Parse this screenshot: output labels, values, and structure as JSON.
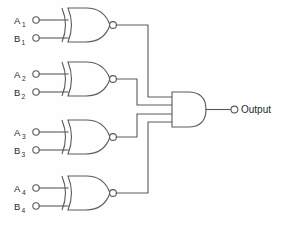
{
  "diagram": {
    "background_color": "#fefefe",
    "line_color": "#5a5a5a",
    "text_color": "#2b2b2b"
  },
  "gates": [
    {
      "id": "xnor1",
      "type": "XNOR",
      "inputs": [
        {
          "label": "A",
          "subscript": "1"
        },
        {
          "label": "B",
          "subscript": "1"
        }
      ]
    },
    {
      "id": "xnor2",
      "type": "XNOR",
      "inputs": [
        {
          "label": "A",
          "subscript": "2"
        },
        {
          "label": "B",
          "subscript": "2"
        }
      ]
    },
    {
      "id": "xnor3",
      "type": "XNOR",
      "inputs": [
        {
          "label": "A",
          "subscript": "3"
        },
        {
          "label": "B",
          "subscript": "3"
        }
      ]
    },
    {
      "id": "xnor4",
      "type": "XNOR",
      "inputs": [
        {
          "label": "A",
          "subscript": "4"
        },
        {
          "label": "B",
          "subscript": "4"
        }
      ]
    },
    {
      "id": "and1",
      "type": "AND",
      "input_count": 4,
      "output": {
        "label": "Output"
      }
    }
  ]
}
